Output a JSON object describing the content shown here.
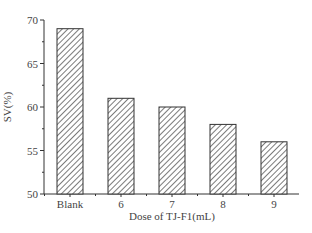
{
  "chart_data": {
    "type": "bar",
    "title": "",
    "xlabel": "Dose of TJ-F1(mL)",
    "ylabel": "SV(%)",
    "categories": [
      "Blank",
      "6",
      "7",
      "8",
      "9"
    ],
    "values": [
      69,
      61,
      60,
      58,
      56
    ],
    "ylim": [
      50,
      70
    ],
    "yticks": [
      50,
      55,
      60,
      65,
      70
    ],
    "grid": false,
    "legend": null,
    "bar_fill": "hatched",
    "bar_color": "#333333"
  }
}
